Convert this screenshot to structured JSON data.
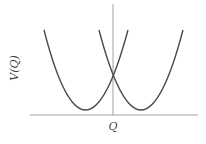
{
  "diagram": {
    "type": "potential-energy-curves",
    "y_label": "V(Q)",
    "x_label": "Q",
    "colors": {
      "curve": "#4a4a4a",
      "axis": "#8a8a8a",
      "text": "#444444"
    },
    "curves": [
      {
        "name": "left-parabola",
        "minimum_x": 85,
        "minimum_y": 110
      },
      {
        "name": "right-parabola",
        "minimum_x": 141,
        "minimum_y": 110
      }
    ],
    "intersection": {
      "x": 113,
      "y": 75
    }
  }
}
